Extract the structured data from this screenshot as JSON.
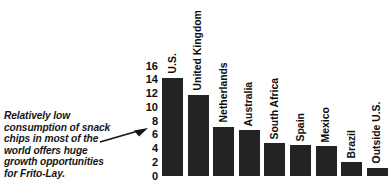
{
  "chart_data": {
    "type": "bar",
    "title": "",
    "subtitle": "",
    "xlabel": "",
    "ylabel": "",
    "categories": [
      "U.S.",
      "United Kingdom",
      "Netherlands",
      "Australia",
      "South Africa",
      "Spain",
      "Mexico",
      "Brazil",
      "Outside U.S."
    ],
    "values": [
      14.3,
      11.8,
      7.2,
      6.7,
      4.8,
      4.5,
      4.3,
      2.0,
      1.2
    ],
    "ylim": [
      0,
      16
    ],
    "yticks": [
      0,
      2,
      4,
      6,
      8,
      10,
      12,
      14,
      16
    ],
    "ytick_labels": [
      "0",
      "2",
      "4",
      "6",
      "8",
      "10",
      "12",
      "14",
      "16"
    ],
    "grid": false,
    "legend": null,
    "bar_color": "#232323",
    "annotations": [
      {
        "text": "Relatively low consumption of snack chips in most of the world offers huge growth opportunities for Frito-Lay.",
        "points_to": "U.S.",
        "style": "italic-bold-with-arrow"
      }
    ]
  },
  "annotation": {
    "text": "Relatively low consumption of snack chips in most of the world offers huge growth opportunities for Frito-Lay."
  }
}
